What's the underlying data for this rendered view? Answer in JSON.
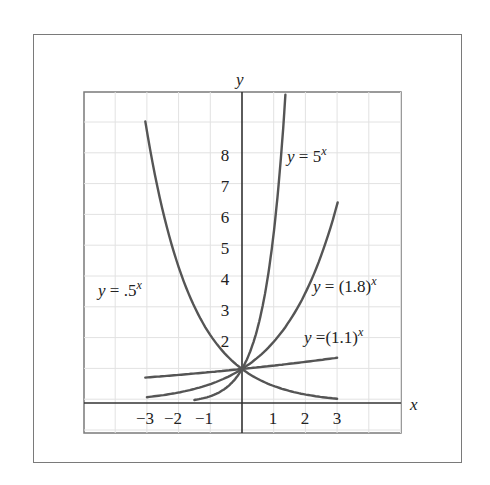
{
  "chart_data": {
    "type": "line",
    "title": "",
    "xlabel": "x",
    "ylabel": "y",
    "xlim": [
      -4.2,
      5
    ],
    "ylim": [
      -0.9,
      9.4
    ],
    "grid": true,
    "legend": "inline labels",
    "x_ticks": [
      {
        "value": -3,
        "label": "−3"
      },
      {
        "value": -2,
        "label": "−2"
      },
      {
        "value": -1,
        "label": "−1"
      },
      {
        "value": 1,
        "label": "1"
      },
      {
        "value": 2,
        "label": "2"
      },
      {
        "value": 3,
        "label": "3"
      }
    ],
    "y_ticks": [
      {
        "value": 2,
        "label": "2"
      },
      {
        "value": 3,
        "label": "3"
      },
      {
        "value": 4,
        "label": "4"
      },
      {
        "value": 5,
        "label": "5"
      },
      {
        "value": 6,
        "label": "6"
      },
      {
        "value": 7,
        "label": "7"
      },
      {
        "value": 8,
        "label": "8"
      }
    ],
    "series": [
      {
        "name": "y = .5^x",
        "base": 0.5,
        "x_range": [
          -3.05,
          3
        ],
        "label_prefix": "y",
        "label_mid": " = .5",
        "label_sup": "x"
      },
      {
        "name": "y = 5^x",
        "base": 5,
        "x_range": [
          -1.5,
          1.37
        ],
        "label_prefix": "y",
        "label_mid": " = 5",
        "label_sup": "x"
      },
      {
        "name": "y = (1.8)^x",
        "base": 1.8,
        "x_range": [
          -3,
          3.02
        ],
        "label_prefix": "y",
        "label_mid": " = (1.8)",
        "label_sup": "x"
      },
      {
        "name": "y = (1.1)^x",
        "base": 1.1,
        "x_range": [
          -3.05,
          3
        ],
        "label_prefix": "y",
        "label_mid": " =(1.1)",
        "label_sup": "x"
      }
    ],
    "points_sampled": {
      "y = .5^x": [
        [
          -3,
          8
        ],
        [
          -2,
          4
        ],
        [
          -1,
          2
        ],
        [
          0,
          1
        ],
        [
          1,
          0.5
        ],
        [
          2,
          0.25
        ],
        [
          3,
          0.125
        ]
      ],
      "y = 5^x": [
        [
          -1.5,
          0.09
        ],
        [
          -1,
          0.2
        ],
        [
          0,
          1
        ],
        [
          1,
          5
        ],
        [
          1.37,
          9.1
        ]
      ],
      "y = (1.8)^x": [
        [
          -3,
          0.17
        ],
        [
          -2,
          0.31
        ],
        [
          -1,
          0.56
        ],
        [
          0,
          1
        ],
        [
          1,
          1.8
        ],
        [
          2,
          3.24
        ],
        [
          3,
          5.83
        ]
      ],
      "y = (1.1)^x": [
        [
          -3,
          0.75
        ],
        [
          -2,
          0.83
        ],
        [
          -1,
          0.91
        ],
        [
          0,
          1
        ],
        [
          1,
          1.1
        ],
        [
          2,
          1.21
        ],
        [
          3,
          1.33
        ]
      ]
    },
    "colors": {
      "curve": "#555555",
      "axis": "#333333",
      "grid": "#e2e2e2",
      "frame": "#7a7a7a"
    }
  }
}
